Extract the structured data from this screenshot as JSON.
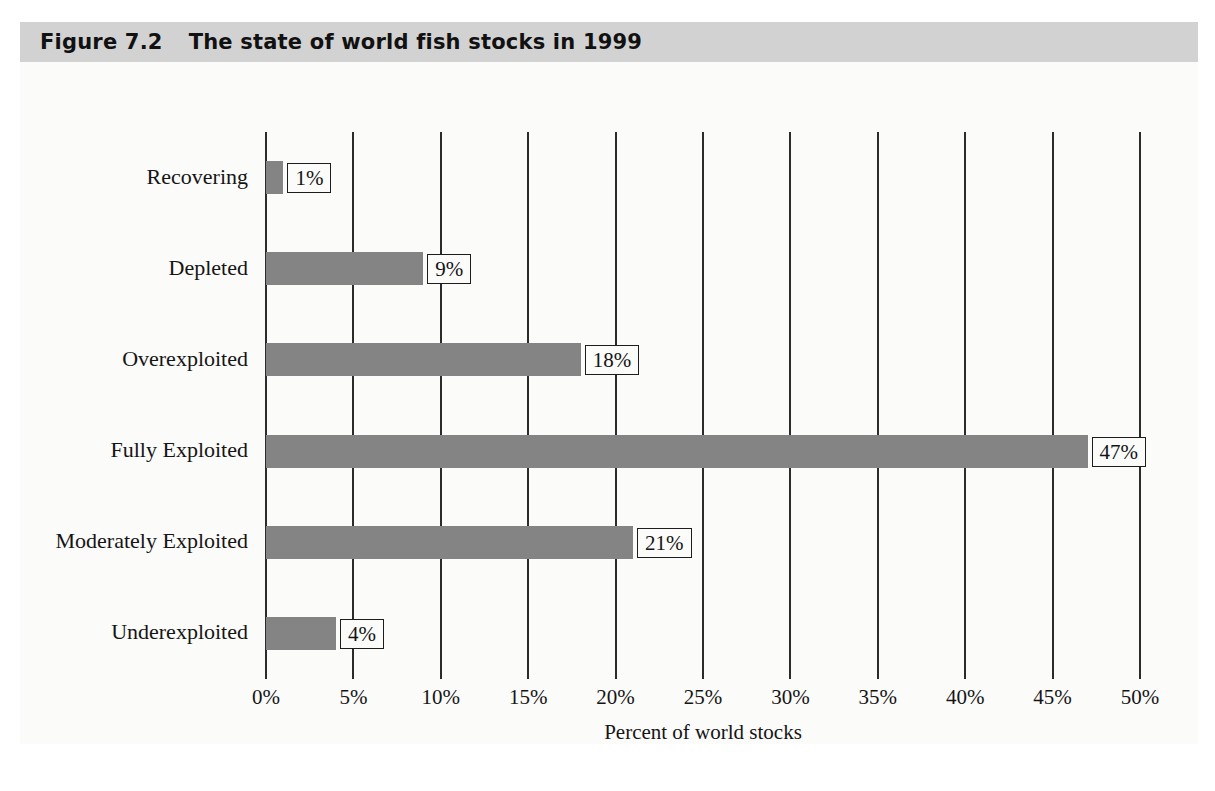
{
  "figure": {
    "number": "Figure 7.2",
    "title": "The state of world fish stocks in 1999"
  },
  "colors": {
    "banner": "#d2d2d2",
    "bar": "#848484",
    "gridline": "#2b2b2b",
    "page": "#fbfbfa",
    "text": "#151515"
  },
  "chart_data": {
    "type": "bar",
    "orientation": "horizontal",
    "title": "The state of world fish stocks in 1999",
    "xlabel": "Percent of world stocks",
    "ylabel": "",
    "xlim": [
      0,
      50
    ],
    "grid": true,
    "legend": "none",
    "categories": [
      "Recovering",
      "Depleted",
      "Overexploited",
      "Fully Exploited",
      "Moderately Exploited",
      "Underexploited"
    ],
    "values": [
      1,
      9,
      18,
      47,
      21,
      4
    ],
    "data_labels": [
      "1%",
      "9%",
      "18%",
      "47%",
      "21%",
      "4%"
    ],
    "xticks": [
      0,
      5,
      10,
      15,
      20,
      25,
      30,
      35,
      40,
      45,
      50
    ],
    "xtick_labels": [
      "0%",
      "5%",
      "10%",
      "15%",
      "20%",
      "25%",
      "30%",
      "35%",
      "40%",
      "45%",
      "50%"
    ]
  }
}
